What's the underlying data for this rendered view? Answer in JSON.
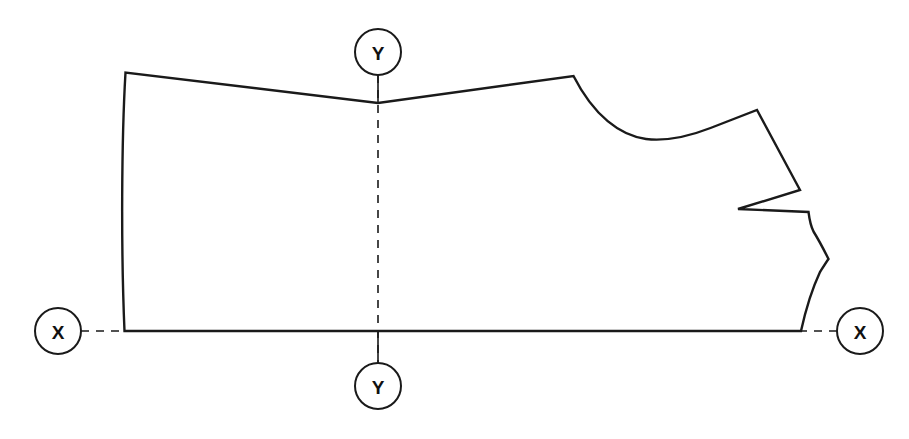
{
  "diagram": {
    "type": "technical-pattern-outline",
    "background_color": "#ffffff",
    "line_color": "#1a1a1a",
    "line_width": 2.4,
    "centerline": {
      "color": "#1a1a1a",
      "width": 1.6,
      "dash": "8 7"
    },
    "markers": [
      {
        "id": "x-left",
        "label": "X",
        "cx": 58,
        "cy": 331,
        "r": 23,
        "leader": {
          "x1": 81,
          "y1": 331,
          "x2": 125,
          "y2": 331
        }
      },
      {
        "id": "x-right",
        "label": "X",
        "cx": 860,
        "cy": 331,
        "r": 23,
        "leader": {
          "x1": 837,
          "y1": 331,
          "x2": 801,
          "y2": 331
        }
      },
      {
        "id": "y-top",
        "label": "Y",
        "cx": 378,
        "cy": 52,
        "r": 23,
        "leader": {
          "x1": 378,
          "y1": 75,
          "x2": 378,
          "y2": 103
        }
      },
      {
        "id": "y-bottom",
        "label": "Y",
        "cx": 378,
        "cy": 386,
        "r": 23,
        "leader": {
          "x1": 378,
          "y1": 363,
          "x2": 378,
          "y2": 331
        }
      }
    ],
    "axes": {
      "x_axis_label": "X",
      "y_axis_label": "Y",
      "x_axis_y": 331,
      "y_axis_x": 378
    },
    "outline_path": "M 125.5 72.5 C 121.5 140 121.0 250 124.5 331.0 L 801.0 331.0 C 806.5 306.0 812.5 288.0 820.0 272.0 C 823.5 266.5 826.0 262.5 828.5 259.0 C 825.0 252.0 820.0 242.0 813.5 231.5 C 811.0 226.5 809.5 220.0 808.5 212.0 L 738.0 209.0 L 800.0 190.0 L 757.0 110.0 L 710.5 128.0 C 690.0 136.0 668.0 141.5 646.0 139.0 C 620.0 135.5 594.0 116.0 573.5 76.0 L 378.0 103.0 L 125.5 72.5 Z",
    "centerline_path": "M 378 75 L 378 363"
  }
}
